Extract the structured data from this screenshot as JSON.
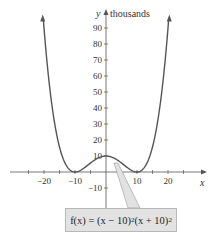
{
  "chart_data": {
    "type": "line",
    "title": "",
    "function": "f(x) = (x − 10)^2 (x + 10)^2",
    "annotation": {
      "prefix": "f(x) = (x − 10)",
      "exp1": "2",
      "mid": "(x + 10)",
      "exp2": "2"
    },
    "xlabel": "x",
    "ylabel": "y",
    "ylabel_unit": "thousands",
    "xlim": [
      -28,
      31
    ],
    "ylim": [
      -15,
      100
    ],
    "x_ticks": [
      -25,
      -20,
      -15,
      -10,
      -5,
      5,
      10,
      15,
      20,
      25
    ],
    "x_tick_labels": [
      {
        "value": -20,
        "label": "−20"
      },
      {
        "value": -10,
        "label": "−10"
      },
      {
        "value": 10,
        "label": "10"
      },
      {
        "value": 20,
        "label": "20"
      }
    ],
    "y_tick_labels": [
      {
        "value": 90,
        "label": "90"
      },
      {
        "value": 80,
        "label": "80"
      },
      {
        "value": 70,
        "label": "70"
      },
      {
        "value": 60,
        "label": "60"
      },
      {
        "value": 50,
        "label": "50"
      },
      {
        "value": 40,
        "label": "40"
      },
      {
        "value": 30,
        "label": "30"
      },
      {
        "value": 20,
        "label": "20"
      },
      {
        "value": 10,
        "label": "10"
      },
      {
        "value": -10,
        "label": "−10"
      }
    ],
    "series": [
      {
        "name": "f(x)",
        "x": [
          -20.4,
          -18,
          -15,
          -12,
          -10,
          -8,
          -5,
          -2,
          0,
          2,
          5,
          8,
          10,
          12,
          15,
          18,
          20.4
        ],
        "y": [
          101.0,
          50.2,
          15.6,
          1.9,
          0,
          1.3,
          5.6,
          9.2,
          10,
          9.2,
          5.6,
          1.3,
          0,
          1.9,
          15.6,
          50.2,
          101.0
        ]
      }
    ],
    "key_points": [
      {
        "x": -10,
        "y": 0,
        "desc": "zero"
      },
      {
        "x": 0,
        "y": 10,
        "desc": "local max (10 thousand)"
      },
      {
        "x": 10,
        "y": 0,
        "desc": "zero"
      }
    ],
    "grid": false,
    "legend": "none"
  }
}
